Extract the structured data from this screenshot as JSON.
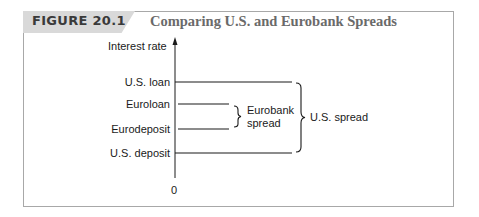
{
  "figure": {
    "number": "FIGURE 20.1",
    "title": "Comparing U.S. and Eurobank Spreads"
  },
  "axis": {
    "y_label": "Interest rate",
    "origin_label": "0"
  },
  "levels": [
    {
      "label": "U.S. loan",
      "y": 82,
      "x_end": 292
    },
    {
      "label": "Euroloan",
      "y": 104,
      "x_end": 229
    },
    {
      "label": "Eurodeposit",
      "y": 129,
      "x_end": 229
    },
    {
      "label": "U.S. deposit",
      "y": 153,
      "x_end": 292
    }
  ],
  "braces": {
    "eurobank_spread": {
      "line1": "Eurobank",
      "line2": "spread"
    },
    "us_spread": {
      "label": "U.S. spread"
    }
  },
  "colors": {
    "border": "#a8a8a8",
    "tab": "#d9d9d9",
    "title": "#6a6a6a",
    "ink": "#1a1a1a"
  }
}
